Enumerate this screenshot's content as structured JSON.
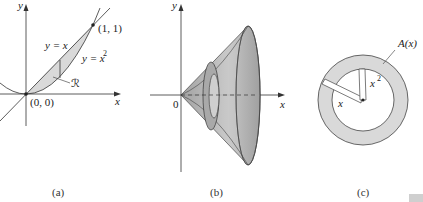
{
  "panels": {
    "a": {
      "caption": "(a)",
      "y_axis_label": "y",
      "x_axis_label": "x",
      "curve_line_label": "y = x",
      "curve_parabola_label": "y = x",
      "parabola_exponent": "2",
      "point_top": "(1, 1)",
      "point_origin": "(0, 0)",
      "region_label": "ℛ"
    },
    "b": {
      "caption": "(b)",
      "y_axis_label": "y",
      "x_axis_label": "x",
      "origin_label": "0"
    },
    "c": {
      "caption": "(c)",
      "area_label": "A(x)",
      "outer_radius_label": "x",
      "inner_radius_label": "x",
      "inner_radius_exponent": "2"
    }
  },
  "colors": {
    "shade": "#d9d9d9",
    "solid": "#bdbdbd",
    "line": "#333333"
  }
}
